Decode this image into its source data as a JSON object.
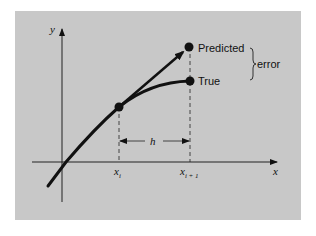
{
  "figure": {
    "type": "euler-method-error-diagram",
    "background_color": "#c8c8c8",
    "axes": {
      "x_label": "x",
      "y_label": "y"
    },
    "points": {
      "predicted_label": "Predicted",
      "true_label": "True"
    },
    "brace_label": "error",
    "step_label": "h",
    "ticks": {
      "xi_base": "x",
      "xi_sub": "i",
      "xi1_base": "x",
      "xi1_sub": "i + 1"
    }
  }
}
